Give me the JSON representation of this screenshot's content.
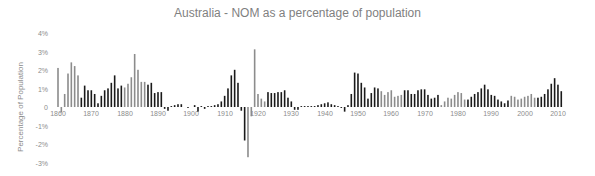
{
  "chart_data": {
    "type": "bar",
    "title": "Australia - NOM as a percentage of population",
    "xlabel": "",
    "ylabel": "Percentage of Population",
    "ylim": [
      -3,
      4
    ],
    "yticks": [
      "4%",
      "3%",
      "2%",
      "1%",
      "0",
      "-1%",
      "-2%",
      "-3%"
    ],
    "xticks": [
      "1860",
      "1870",
      "1880",
      "1890",
      "1900",
      "1910",
      "1920",
      "1930",
      "1940",
      "1950",
      "1960",
      "1970",
      "1980",
      "1990",
      "2000",
      "2010"
    ],
    "grid": false,
    "legend": null,
    "x_start": 1860,
    "values": [
      2.1,
      -0.3,
      0.7,
      1.8,
      2.4,
      2.2,
      1.7,
      0.5,
      1.15,
      0.9,
      0.9,
      0.7,
      0.2,
      0.6,
      0.9,
      1.0,
      1.3,
      1.7,
      1.0,
      1.15,
      1.05,
      1.25,
      1.6,
      2.85,
      2.0,
      1.35,
      1.35,
      1.2,
      1.3,
      0.75,
      0.8,
      0.8,
      -0.1,
      -0.2,
      0.05,
      0.1,
      0.15,
      0.15,
      0.0,
      -0.05,
      0.0,
      0.1,
      -0.25,
      0.05,
      -0.1,
      0.05,
      0.05,
      0.1,
      0.15,
      0.3,
      0.6,
      1.0,
      1.7,
      2.0,
      1.3,
      -0.2,
      -1.8,
      -2.7,
      -0.5,
      3.1,
      0.7,
      0.45,
      0.3,
      0.8,
      0.75,
      0.75,
      0.8,
      0.8,
      0.9,
      0.5,
      0.3,
      -0.15,
      -0.15,
      0.05,
      0.05,
      0.05,
      0.05,
      0.05,
      0.1,
      0.15,
      0.2,
      0.25,
      0.15,
      0.1,
      0.05,
      -0.05,
      -0.25,
      0.1,
      0.7,
      1.85,
      1.8,
      1.3,
      1.05,
      0.45,
      0.75,
      1.05,
      1.0,
      0.85,
      0.65,
      0.8,
      0.9,
      0.55,
      0.6,
      0.65,
      0.9,
      0.9,
      0.7,
      0.7,
      0.9,
      0.95,
      0.95,
      0.65,
      0.45,
      0.5,
      0.65,
      0.1,
      0.3,
      0.5,
      0.45,
      0.65,
      0.8,
      0.75,
      0.4,
      0.4,
      0.55,
      0.7,
      0.8,
      1.0,
      1.2,
      0.95,
      0.65,
      0.6,
      0.4,
      0.3,
      0.2,
      0.35,
      0.6,
      0.55,
      0.4,
      0.45,
      0.55,
      0.6,
      0.7,
      0.5,
      0.5,
      0.55,
      0.7,
      0.95,
      1.25,
      1.55,
      1.2,
      0.85
    ]
  },
  "colors": {
    "bar_dark": "#1a1a1a",
    "bar_light": "#8c8c8c",
    "text": "#8c8c8c",
    "title": "#7f7f7f"
  }
}
